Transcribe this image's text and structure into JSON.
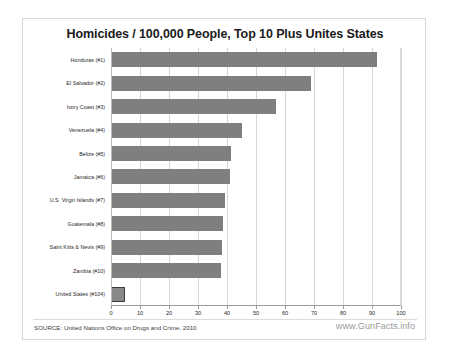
{
  "chart_data": {
    "type": "bar",
    "orientation": "horizontal",
    "title": "Homicides / 100,000 People, Top 10 Plus Unites States",
    "xlabel": "",
    "ylabel": "",
    "xlim": [
      0,
      100
    ],
    "xticks": [
      0,
      10,
      20,
      30,
      40,
      50,
      60,
      70,
      80,
      90,
      100
    ],
    "grid": true,
    "legend": null,
    "categories": [
      "Honduras (#1)",
      "El Salvador (#2)",
      "Ivory Coast (#3)",
      "Venezuela (#4)",
      "Belize (#5)",
      "Jamaica (#6)",
      "U.S. Virgin Islands (#7)",
      "Guatemala (#8)",
      "Saint Kitts & Nevis (#9)",
      "Zambia (#10)",
      "United States (#104)"
    ],
    "values": [
      91.6,
      69.0,
      56.9,
      45.1,
      41.4,
      40.9,
      39.2,
      38.5,
      38.2,
      38.0,
      4.8
    ],
    "bar_color": "#7f7f7f",
    "highlight_index": 10,
    "highlight_color": "#898989",
    "highlight_border_color": "#3c3c3c"
  },
  "footer": {
    "source": "SOURCE: United Nations Office on Drugs and Crime, 2010",
    "watermark": "www.GunFacts.info"
  }
}
